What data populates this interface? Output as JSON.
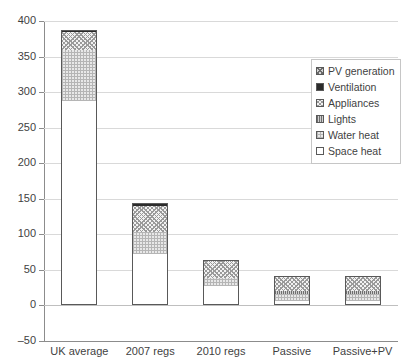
{
  "chart_data": {
    "type": "bar",
    "subtype": "stacked-column",
    "title": "",
    "xlabel": "",
    "ylabel": "",
    "ylim": [
      -50,
      400
    ],
    "ytick_step": 50,
    "yticks": [
      "400",
      "350",
      "300",
      "250",
      "200",
      "150",
      "100",
      "50",
      "0",
      "-50"
    ],
    "grid": true,
    "legend_position": "upper right",
    "categories": [
      "UK average",
      "2007 regs",
      "2010 regs",
      "Passive",
      "Passive+PV"
    ],
    "series": [
      {
        "name": "Space heat",
        "key": "space",
        "values": [
          287,
          72,
          28,
          6,
          6
        ]
      },
      {
        "name": "Water heat",
        "key": "water",
        "values": [
          72,
          32,
          10,
          10,
          10
        ]
      },
      {
        "name": "Lights",
        "key": "lights",
        "values": [
          0,
          0,
          0,
          4,
          4
        ]
      },
      {
        "name": "Appliances",
        "key": "appliances",
        "values": [
          25,
          36,
          24,
          20,
          20
        ]
      },
      {
        "name": "Ventilation",
        "key": "ventilation",
        "values": [
          4,
          4,
          2,
          2,
          2
        ]
      },
      {
        "name": "PV generation",
        "key": "pv",
        "values": [
          0,
          0,
          0,
          0,
          0
        ]
      }
    ],
    "totals": [
      388,
      144,
      64,
      42,
      42
    ]
  },
  "legend": {
    "items": [
      {
        "label": "PV generation",
        "swatch": "pv-swatch"
      },
      {
        "label": "Ventilation",
        "swatch": "ventilation-swatch"
      },
      {
        "label": "Appliances",
        "swatch": "appliances-swatch"
      },
      {
        "label": "Lights",
        "swatch": "lights-swatch"
      },
      {
        "label": "Water heat",
        "swatch": "water-heat-swatch"
      },
      {
        "label": "Space heat",
        "swatch": "space-heat-swatch"
      }
    ]
  },
  "colors": {
    "ventilation": "#2b2b2b",
    "space_heat": "#ffffff",
    "gridline": "#d9d9d9",
    "axis": "#8c8c8c",
    "outline": "#595959",
    "text": "#3f3f3f"
  }
}
